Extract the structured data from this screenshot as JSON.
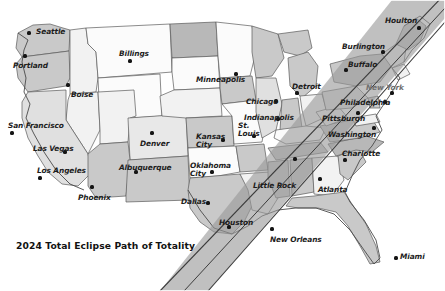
{
  "caption": {
    "text": "2024 Total Eclipse Path of Totality"
  },
  "colors": {
    "background": "#ffffff",
    "state_light": "#f2f2f2",
    "state_white": "#fbfbfb",
    "state_mid": "#c9c9c9",
    "state_dark": "#b0b0b0",
    "border": "#5a5a5a",
    "coast": "#4a4a4a",
    "band_fill": "#9a9a9a",
    "band_edge": "#3a3a3a",
    "band_center": "#2e2e2e",
    "label": "#1d1d1d",
    "label_dim": "#6f6f6f",
    "dot": "#141414"
  },
  "map": {
    "title": "United States map with 2024 total solar eclipse path of totality",
    "projection_note": "contiguous United States, outline map"
  },
  "eclipse_path": {
    "name": "path-of-totality-band",
    "description": "Diagonal shaded swath crossing from southwest Texas to northeast Maine",
    "entry_label": "Texas / Mexico border",
    "exit_label": "Maine / Canada border"
  },
  "cities": [
    {
      "name": "Seattle",
      "label": "Seattle",
      "x": 36,
      "y": 28,
      "dot_x": 29,
      "dot_y": 33,
      "align": "left",
      "dim": false
    },
    {
      "name": "Portland",
      "label": "Portland",
      "x": 13,
      "y": 62,
      "dot_x": 25,
      "dot_y": 56,
      "align": "left",
      "dim": false
    },
    {
      "name": "Boise",
      "label": "Boise",
      "x": 71,
      "y": 91,
      "dot_x": 68,
      "dot_y": 85,
      "align": "left",
      "dim": false
    },
    {
      "name": "Billings",
      "label": "Billings",
      "x": 119,
      "y": 50,
      "dot_x": 130,
      "dot_y": 61,
      "align": "left",
      "dim": false
    },
    {
      "name": "San Francisco",
      "label": "San Francisco",
      "x": 8,
      "y": 122,
      "dot_x": 12,
      "dot_y": 133,
      "align": "left",
      "dim": false
    },
    {
      "name": "Las Vegas",
      "label": "Las Vegas",
      "x": 33,
      "y": 145,
      "dot_x": 65,
      "dot_y": 152,
      "align": "left",
      "dim": false
    },
    {
      "name": "Los Angeles",
      "label": "Los Angeles",
      "x": 37,
      "y": 167,
      "dot_x": 40,
      "dot_y": 178,
      "align": "left",
      "dim": false
    },
    {
      "name": "Phoenix",
      "label": "Phoenix",
      "x": 78,
      "y": 194,
      "dot_x": 92,
      "dot_y": 187,
      "align": "left",
      "dim": false
    },
    {
      "name": "Denver",
      "label": "Denver",
      "x": 140,
      "y": 140,
      "dot_x": 152,
      "dot_y": 133,
      "align": "left",
      "dim": false
    },
    {
      "name": "Albuquerque",
      "label": "Albuquerque",
      "x": 119,
      "y": 164,
      "dot_x": 136,
      "dot_y": 172,
      "align": "left",
      "dim": false
    },
    {
      "name": "Minneapolis",
      "label": "Minneapolis",
      "x": 196,
      "y": 76,
      "dot_x": 236,
      "dot_y": 74,
      "align": "left",
      "dim": false
    },
    {
      "name": "Kansas City",
      "label": "Kansas\nCity",
      "x": 196,
      "y": 133,
      "dot_x": 223,
      "dot_y": 140,
      "align": "left",
      "dim": false
    },
    {
      "name": "Oklahoma City",
      "label": "Oklahoma\nCity",
      "x": 190,
      "y": 162,
      "dot_x": 212,
      "dot_y": 172,
      "align": "left",
      "dim": false
    },
    {
      "name": "Dallas",
      "label": "Dallas",
      "x": 181,
      "y": 198,
      "dot_x": 208,
      "dot_y": 203,
      "align": "left",
      "dim": false
    },
    {
      "name": "Houston",
      "label": "Houston",
      "x": 219,
      "y": 219,
      "dot_x": 229,
      "dot_y": 227,
      "align": "left",
      "dim": false
    },
    {
      "name": "New Orleans",
      "label": "New Orleans",
      "x": 270,
      "y": 236,
      "dot_x": 272,
      "dot_y": 229,
      "align": "left",
      "dim": false
    },
    {
      "name": "St. Louis",
      "label": "St.\nLouis",
      "x": 238,
      "y": 122,
      "dot_x": 254,
      "dot_y": 136,
      "align": "left",
      "dim": false
    },
    {
      "name": "Chicago",
      "label": "Chicago",
      "x": 246,
      "y": 98,
      "dot_x": 276,
      "dot_y": 101,
      "align": "left",
      "dim": false
    },
    {
      "name": "Indianapolis",
      "label": "Indianapolis",
      "x": 244,
      "y": 114,
      "dot_x": 278,
      "dot_y": 119,
      "align": "left",
      "dim": false
    },
    {
      "name": "Detroit",
      "label": "Detroit",
      "x": 292,
      "y": 83,
      "dot_x": 297,
      "dot_y": 93,
      "align": "left",
      "dim": false
    },
    {
      "name": "Buffalo",
      "label": "Buffalo",
      "x": 348,
      "y": 61,
      "dot_x": 346,
      "dot_y": 70,
      "align": "left",
      "dim": false
    },
    {
      "name": "Burlington",
      "label": "Burlington",
      "x": 342,
      "y": 43,
      "dot_x": 383,
      "dot_y": 52,
      "align": "left",
      "dim": false
    },
    {
      "name": "Houlton",
      "label": "Houlton",
      "x": 385,
      "y": 17,
      "dot_x": 419,
      "dot_y": 28,
      "align": "left",
      "dim": false
    },
    {
      "name": "New York",
      "label": "New York",
      "x": 366,
      "y": 84,
      "dot_x": 392,
      "dot_y": 93,
      "align": "left",
      "dim": true
    },
    {
      "name": "Philadelphia",
      "label": "Philadelphia",
      "x": 340,
      "y": 99,
      "dot_x": 385,
      "dot_y": 102,
      "align": "left",
      "dim": false
    },
    {
      "name": "Pittsburgh",
      "label": "Pittsburgh",
      "x": 322,
      "y": 115,
      "dot_x": 358,
      "dot_y": 113,
      "align": "left",
      "dim": false
    },
    {
      "name": "Washington",
      "label": "Washington",
      "x": 328,
      "y": 131,
      "dot_x": 374,
      "dot_y": 128,
      "align": "left",
      "dim": false
    },
    {
      "name": "Charlotte",
      "label": "Charlotte",
      "x": 342,
      "y": 150,
      "dot_x": 345,
      "dot_y": 160,
      "align": "left",
      "dim": false
    },
    {
      "name": "Atlanta",
      "label": "Atlanta",
      "x": 318,
      "y": 186,
      "dot_x": 320,
      "dot_y": 179,
      "align": "left",
      "dim": false
    },
    {
      "name": "Little Rock",
      "label": "Little Rock",
      "x": 253,
      "y": 182,
      "dot_x": 295,
      "dot_y": 159,
      "align": "left",
      "dim": false
    },
    {
      "name": "Miami",
      "label": "Miami",
      "x": 400,
      "y": 253,
      "dot_x": 396,
      "dot_y": 258,
      "align": "left",
      "dim": false
    }
  ]
}
